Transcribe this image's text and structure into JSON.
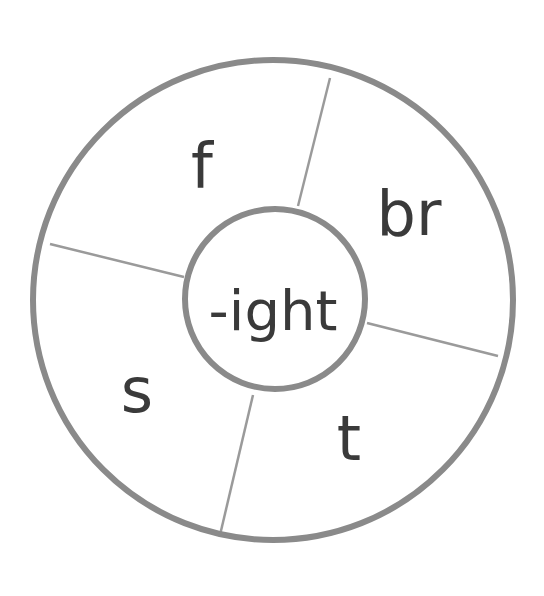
{
  "diagram": {
    "type": "word-family-wheel",
    "center_label": "-ight",
    "segments": [
      {
        "label": "f",
        "position": "top-left"
      },
      {
        "label": "br",
        "position": "top-right"
      },
      {
        "label": "t",
        "position": "bottom-right"
      },
      {
        "label": "s",
        "position": "bottom-left"
      }
    ],
    "colors": {
      "ring_stroke": "#8a8a8a",
      "divider_stroke": "#9a9a9a",
      "text": "#3a3a3a",
      "background": "#ffffff"
    }
  }
}
